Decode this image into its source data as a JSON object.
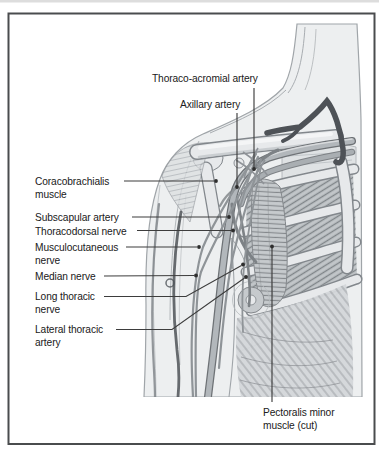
{
  "diagram": {
    "labels": [
      {
        "name": "thoraco-acromial-artery",
        "lines": [
          "Thoraco-acromial artery"
        ]
      },
      {
        "name": "axillary-artery",
        "lines": [
          "Axillary artery"
        ]
      },
      {
        "name": "coracobrachialis-muscle",
        "lines": [
          "Coracobrachialis",
          "muscle"
        ]
      },
      {
        "name": "subscapular-artery",
        "lines": [
          "Subscapular artery"
        ]
      },
      {
        "name": "thoracodorsal-nerve",
        "lines": [
          "Thoracodorsal nerve"
        ]
      },
      {
        "name": "musculocutaneous-nerve",
        "lines": [
          "Musculocutaneous",
          "nerve"
        ]
      },
      {
        "name": "median-nerve",
        "lines": [
          "Median nerve"
        ]
      },
      {
        "name": "long-thoracic-nerve",
        "lines": [
          "Long thoracic",
          "nerve"
        ]
      },
      {
        "name": "lateral-thoracic-artery",
        "lines": [
          "Lateral thoracic",
          "artery"
        ]
      },
      {
        "name": "pectoralis-minor-muscle",
        "lines": [
          "Pectoralis minor",
          "muscle (cut)"
        ]
      }
    ],
    "colors": {
      "frame": "#4a4c4e",
      "label_text": "#202020",
      "leader_line": "#3d3d3d",
      "leader_dot": "#2e2e2e",
      "skin": "#edeff0",
      "skin_outline": "#a0a5a9",
      "bone": "#e7e9eb",
      "bone_edge": "#82878c",
      "muscle": "#c6cacd",
      "muscle_fiber": "#84888c",
      "artery": "#b2b7bb",
      "artery_edge": "#6e7276",
      "vein_dark": "#4e5257",
      "nerve": "#8f9498"
    }
  }
}
